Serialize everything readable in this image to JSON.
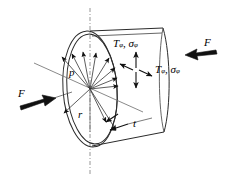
{
  "figure": {
    "background_color": "#ffffff",
    "line_color": "#2b2b2b",
    "centerline_color": "#8a8a8a"
  },
  "labels": {
    "pressure": "p",
    "radius": "r",
    "thickness": "t",
    "force_left": "F",
    "force_right": "F",
    "stress_upper_T": "T",
    "stress_upper_T_sub": "φ",
    "stress_upper_comma": ", ",
    "stress_upper_sigma": "σ",
    "stress_upper_sigma_sub": "φ",
    "stress_right_T": "T",
    "stress_right_T_sub": "φ",
    "stress_right_comma": ", ",
    "stress_right_sigma": "σ",
    "stress_right_sigma_sub": "φ"
  },
  "icons": {
    "force_left_arrow": "thick-arrow-right-icon",
    "force_right_arrow": "thick-arrow-left-icon",
    "pressure_arrows": "radial-arrow-fan-icon",
    "stress_cross": "biaxial-stress-cross-icon",
    "thickness_leader": "leader-line-icon",
    "axis_centerline": "dash-dot-centerline-icon"
  },
  "geometry": {
    "ellipse_center_x": 90,
    "ellipse_center_y": 89,
    "ellipse_rx": 27,
    "ellipse_ry": 58,
    "wall_offset": 3,
    "cylinder_right_x": 165,
    "centerline_x": 90
  }
}
